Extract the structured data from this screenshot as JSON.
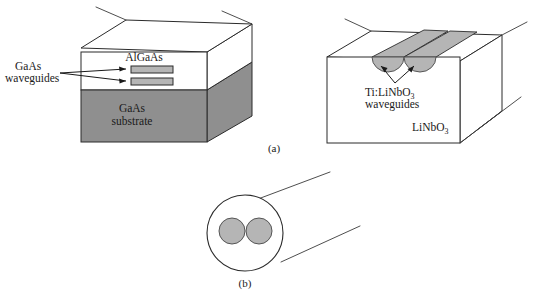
{
  "figure": {
    "background_color": "#ffffff",
    "line_color": "#2b2b2b",
    "gray_substrate": "#8f8f8f",
    "gray_waveguide": "#b5b5b5",
    "gray_stripe": "#b5b5b5"
  },
  "panel_a": {
    "caption": "(a)",
    "left_structure": {
      "top_layer_label": "AlGaAs",
      "substrate_label_line1": "GaAs",
      "substrate_label_line2": "substrate",
      "waveguide_label_line1": "GaAs",
      "waveguide_label_line2": "waveguides",
      "waveguide_count": 2
    },
    "right_structure": {
      "bulk_label": "LiNbO",
      "bulk_label_sub": "3",
      "waveguide_label_line1_pre": "Ti:LiNbO",
      "waveguide_label_line1_sub": "3",
      "waveguide_label_line2": "waveguides",
      "waveguide_count": 2
    }
  },
  "panel_b": {
    "caption": "(b)",
    "core_count": 2,
    "description": "Twin-core fiber cross section"
  }
}
